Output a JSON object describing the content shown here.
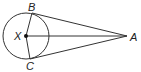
{
  "diagram": {
    "type": "geometry",
    "circle": {
      "center_label": "X",
      "cx": 26,
      "cy": 36,
      "r": 23
    },
    "points": [
      {
        "label": "X",
        "x": 26,
        "y": 36
      },
      {
        "label": "B",
        "x": 32,
        "y": 13
      },
      {
        "label": "C",
        "x": 30,
        "y": 59
      },
      {
        "label": "A",
        "x": 127,
        "y": 36
      }
    ],
    "segments": [
      [
        "B",
        "A"
      ],
      [
        "C",
        "A"
      ],
      [
        "X",
        "A"
      ],
      [
        "B",
        "X"
      ],
      [
        "X",
        "C"
      ]
    ],
    "stroke_color": "#333333"
  },
  "labels": {
    "X": "X",
    "B": "B",
    "C": "C",
    "A": "A"
  }
}
